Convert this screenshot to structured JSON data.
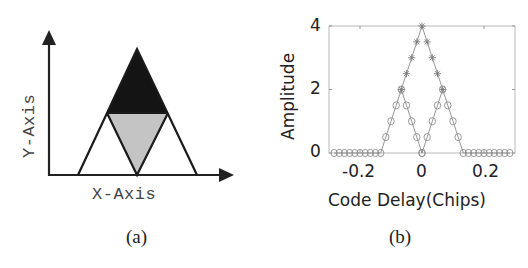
{
  "panel_a": {
    "caption": "(a)",
    "x_axis_label": "X-Axis",
    "y_axis_label": "Y-Axis",
    "colors": {
      "axis": "#222222",
      "top_fill": "#141414",
      "middle_fill": "#c4c4c4",
      "outline": "#1a1a1a"
    }
  },
  "panel_b": {
    "caption": "(b)",
    "x_ticks": [
      "-0.2",
      "0",
      "0.2"
    ],
    "y_ticks": [
      "0",
      "2",
      "4"
    ]
  },
  "chart_data": [
    {
      "type": "diagram",
      "title": "(a)",
      "xlabel": "X-Axis",
      "ylabel": "Y-Axis",
      "description": "Large triangle split by a horizontal line at half height; top triangle filled black, inverted middle triangle filled gray, two white side triangles.",
      "shapes": [
        {
          "name": "outer-triangle",
          "points": [
            [
              -1,
              0
            ],
            [
              0,
              2
            ],
            [
              1,
              0
            ]
          ]
        },
        {
          "name": "top-triangle",
          "points": [
            [
              -0.5,
              1
            ],
            [
              0,
              2
            ],
            [
              0.5,
              1
            ]
          ],
          "fill": "black"
        },
        {
          "name": "inverted-middle-triangle",
          "points": [
            [
              -0.5,
              1
            ],
            [
              0.5,
              1
            ],
            [
              0,
              0
            ]
          ],
          "fill": "gray"
        }
      ]
    },
    {
      "type": "line",
      "title": "(b)",
      "xlabel": "Code Delay(Chips)",
      "ylabel": "Amplitude",
      "xlim": [
        -0.3,
        0.3
      ],
      "ylim": [
        0,
        4
      ],
      "x_ticks": [
        -0.2,
        0,
        0.2
      ],
      "y_ticks": [
        0,
        2,
        4
      ],
      "grid": false,
      "series": [
        {
          "name": "combined-peak",
          "marker": "star",
          "x": [
            -0.0667,
            -0.05,
            -0.0333,
            -0.0167,
            0,
            0.0167,
            0.0333,
            0.05,
            0.0667
          ],
          "y": [
            2,
            2.5,
            3,
            3.5,
            4,
            3.5,
            3,
            2.5,
            2
          ]
        },
        {
          "name": "left-correlation",
          "marker": "circle",
          "x": [
            -0.2833,
            -0.2667,
            -0.25,
            -0.2333,
            -0.2167,
            -0.2,
            -0.1833,
            -0.1667,
            -0.15,
            -0.1333,
            -0.1167,
            -0.1,
            -0.0833,
            -0.0667,
            -0.05,
            -0.0333,
            -0.0167,
            0
          ],
          "y": [
            0,
            0,
            0,
            0,
            0,
            0,
            0,
            0,
            0,
            0,
            0.5,
            1,
            1.5,
            2,
            1.5,
            1,
            0.5,
            0
          ]
        },
        {
          "name": "right-correlation",
          "marker": "circle",
          "x": [
            0,
            0.0167,
            0.0333,
            0.05,
            0.0667,
            0.0833,
            0.1,
            0.1167,
            0.1333,
            0.15,
            0.1667,
            0.1833,
            0.2,
            0.2167,
            0.2333,
            0.25,
            0.2667,
            0.2833
          ],
          "y": [
            0,
            0.5,
            1,
            1.5,
            2,
            1.5,
            1,
            0.5,
            0,
            0,
            0,
            0,
            0,
            0,
            0,
            0,
            0,
            0
          ]
        }
      ]
    }
  ]
}
